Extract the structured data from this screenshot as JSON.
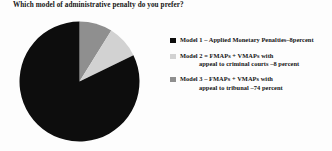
{
  "chart_data": {
    "type": "pie",
    "title": "Which model of administrative penalty do you prefer?",
    "categories": [
      "Model 1 – Applied Monetary Penalties–8percent",
      "Model 2 = FMAPs + VMAPs with appeal to criminal courts –8 percent",
      "Model 3 – FMAPs + VMAPs with appeal to tribunal –74 percent"
    ],
    "values": [
      8,
      8,
      74
    ],
    "value_unit": "percent",
    "colors": [
      "#0d0d0d",
      "#d2d2d2",
      "#8f8f8f"
    ],
    "legend_position": "right",
    "start_angle_deg": 0,
    "direction": "clockwise",
    "slice_order": [
      "Model 3 gray wedge",
      "Model 2 light wedge",
      "Model 1 black remainder"
    ],
    "grid": false,
    "xlabel": "",
    "ylabel": ""
  },
  "title": {
    "text": "Which model of administrative penalty do you prefer?"
  },
  "legend": {
    "items": [
      {
        "swatch_color": "#0d0d0d",
        "line1": "Model 1 –  Applied  Monetary Penalties–8percent",
        "line2": ""
      },
      {
        "swatch_color": "#d2d2d2",
        "line1": "Model 2 =  FMAPs + VMAPs with",
        "line2": "appeal to criminal courts –8 percent"
      },
      {
        "swatch_color": "#8f8f8f",
        "line1": "Model 3 –  FMAPs + VMAPs  with",
        "line2": "appeal to tribunal –74 percent"
      }
    ]
  },
  "pie": {
    "slices": [
      {
        "name": "model-3-tribunal",
        "percent": 74,
        "color": "#0d0d0d"
      },
      {
        "name": "model-1-amp",
        "percent": 8,
        "color": "#8f8f8f"
      },
      {
        "name": "model-2-criminal-courts",
        "percent": 8,
        "color": "#d2d2d2"
      }
    ]
  }
}
